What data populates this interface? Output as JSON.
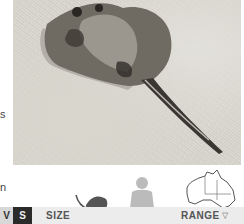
{
  "photo": {
    "subject": "stingray on sandy seabed",
    "icon": "stingray-photo"
  },
  "margin_text": {
    "fragment_1": "s",
    "fragment_2": "n"
  },
  "status_tags": {
    "v": "V",
    "s": "S"
  },
  "size": {
    "label": "SIZE",
    "icons": [
      "stingray-silhouette-icon",
      "human-silhouette-icon"
    ]
  },
  "range": {
    "label": "RANGE",
    "icon": "australia-map-icon",
    "marker": "▽"
  },
  "colors": {
    "tag_v_bg": "#d8d8d8",
    "tag_s_bg": "#2b2b2b",
    "bar_bg": "#ececec",
    "silhouette": "#666666",
    "human_silhouette": "#bbbbbb"
  }
}
